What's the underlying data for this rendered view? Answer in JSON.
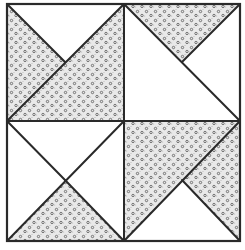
{
  "diagram": {
    "title": "",
    "type": "quilt-block",
    "colors": {
      "background": "#ffffff",
      "outline": "#2a2a2a",
      "fabric_base": "#e9e9e9",
      "fabric_dot": "#555555"
    },
    "block": {
      "x": 7,
      "y": 4,
      "size_w": 233,
      "size_h": 237,
      "center": [
        124,
        121
      ]
    },
    "quadrants": [
      {
        "id": "top-left",
        "description": "shaded except top white triangle"
      },
      {
        "id": "top-right",
        "description": "shaded top triangle, rest white"
      },
      {
        "id": "bottom-left",
        "description": "shaded bottom triangle, rest white"
      },
      {
        "id": "bottom-right",
        "description": "shaded except bottom white triangle"
      }
    ]
  }
}
